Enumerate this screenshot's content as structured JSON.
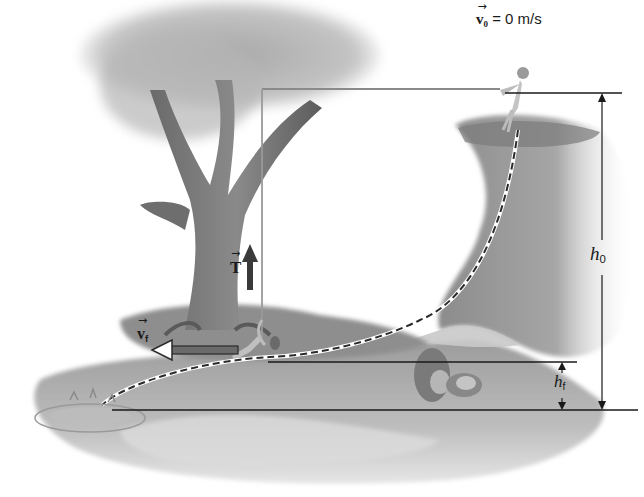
{
  "figure": {
    "labels": {
      "v0": {
        "symbol": "v",
        "subscript": "0",
        "equals": "= 0 m/s"
      },
      "T": {
        "symbol": "T"
      },
      "vf": {
        "symbol": "v",
        "subscript": "f"
      },
      "h0": {
        "symbol": "h",
        "subscript": "0"
      },
      "hf": {
        "symbol": "h",
        "subscript": "f"
      }
    },
    "colors": {
      "ink": "#1a1a1a",
      "rope": "#8a8a8a",
      "tree_dark": "#5a5a5a",
      "foliage": "#b8b8b8",
      "cliff": "#9a9a9a",
      "water": "#c8c8c8",
      "ground": "#a8a8a8",
      "arrow_dark": "#3a3a3a"
    }
  }
}
